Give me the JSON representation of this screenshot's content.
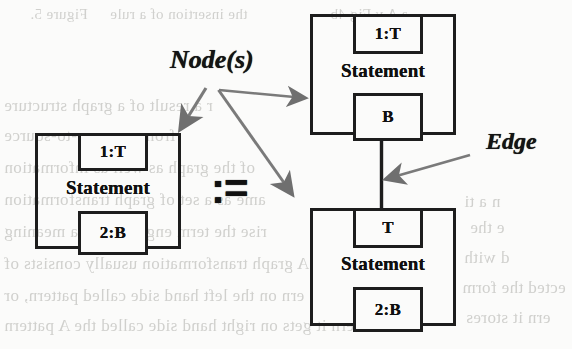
{
  "figure": {
    "kind": "graph-rewrite-rule",
    "operator": ":=",
    "annotations": [
      {
        "id": "nodes",
        "label": "Node(s)"
      },
      {
        "id": "edge",
        "label": "Edge"
      }
    ]
  },
  "lhs": {
    "node": {
      "label": "Statement",
      "top_port": "1:T",
      "bottom_port": "2:B"
    }
  },
  "rhs": {
    "nodes": [
      {
        "label": "Statement",
        "top_port": "1:T",
        "bottom_port": "B"
      },
      {
        "label": "Statement",
        "top_port": "T",
        "bottom_port": "2:B"
      }
    ],
    "edge": {
      "from": "B",
      "to": "T"
    }
  },
  "colors": {
    "ink": "#1d1d1d",
    "text": "#101010",
    "annotation": "#141414",
    "arrow": "#6f6f6f",
    "paper": "#fbfbfa",
    "ghost": "#c9c9c6"
  },
  "ghost_text": [
    {
      "id": "g1",
      "text": "Figure 5.",
      "left": 30,
      "top": 6,
      "size": 15
    },
    {
      "id": "g2",
      "text": "the insertion of a rule",
      "left": 110,
      "top": 6,
      "size": 15
    },
    {
      "id": "g3",
      "text": "a A   v   Fig  4b",
      "left": 330,
      "top": 6,
      "size": 15
    },
    {
      "id": "g4",
      "text": "r a result of a graph structure",
      "left": 4,
      "top": 96,
      "size": 17
    },
    {
      "id": "g5",
      "text": "from a source-to-source",
      "left": 4,
      "top": 126,
      "size": 17
    },
    {
      "id": "g6",
      "text": "of the graph as well as information",
      "left": 4,
      "top": 158,
      "size": 17
    },
    {
      "id": "g7",
      "text": "ame as a set of graph transformation",
      "left": 4,
      "top": 190,
      "size": 17
    },
    {
      "id": "g8",
      "text": "rise the term engineering, a meaning",
      "left": 4,
      "top": 222,
      "size": 17
    },
    {
      "id": "g9",
      "text": "A graph transformation usually consists of",
      "left": 4,
      "top": 254,
      "size": 17
    },
    {
      "id": "g10",
      "text": "ern on the left hand side called pattern, or",
      "left": 4,
      "top": 286,
      "size": 17
    },
    {
      "id": "g11",
      "text": "tern it gets on right hand side called the  A pattern",
      "left": 4,
      "top": 316,
      "size": 17
    },
    {
      "id": "g12",
      "text": "n a ti",
      "left": 464,
      "top": 192,
      "size": 17
    },
    {
      "id": "g13",
      "text": "e the",
      "left": 470,
      "top": 218,
      "size": 17
    },
    {
      "id": "g14",
      "text": "d    with",
      "left": 464,
      "top": 248,
      "size": 17
    },
    {
      "id": "g15",
      "text": "ected the form",
      "left": 462,
      "top": 278,
      "size": 17
    },
    {
      "id": "g16",
      "text": "ern it stores",
      "left": 466,
      "top": 308,
      "size": 17
    }
  ]
}
